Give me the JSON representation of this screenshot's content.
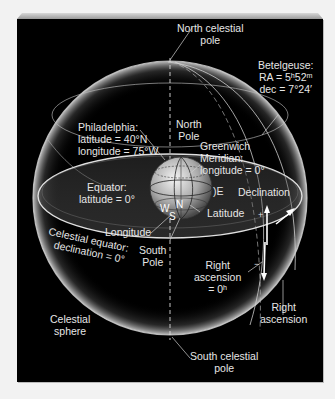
{
  "diagram": {
    "background": "#000000",
    "labels": {
      "north_celestial_pole": [
        "North celestial",
        "pole"
      ],
      "betelgeuse": [
        "Betelgeuse:",
        "RA = 5ʰ52ᵐ",
        "dec = 7°24′"
      ],
      "philadelphia": [
        "Philadelphia:",
        "latitude = 40°N",
        "longitude = 75°W"
      ],
      "north_pole": [
        "North",
        "Pole"
      ],
      "greenwich": [
        "Greenwich",
        "Meridian:",
        "longitude = 0°"
      ],
      "equator": [
        "Equator:",
        "latitude = 0°"
      ],
      "declination": "Declination",
      "east": "E",
      "latitude": "Latitude",
      "longitude": "Longitude",
      "celestial_equator": [
        "Celestial equator:",
        "declination = 0°"
      ],
      "south_pole": [
        "South",
        "Pole"
      ],
      "right_ascension_zero": [
        "Right",
        "ascension",
        "= 0ʰ"
      ],
      "right_ascension": [
        "Right",
        "ascension"
      ],
      "celestial_sphere": [
        "Celestial",
        "sphere"
      ],
      "south_celestial_pole": [
        "South celestial",
        "pole"
      ],
      "globe_markers": {
        "west": "W",
        "north": "N",
        "south": "S"
      },
      "plus": "+",
      "minus": "−"
    }
  }
}
